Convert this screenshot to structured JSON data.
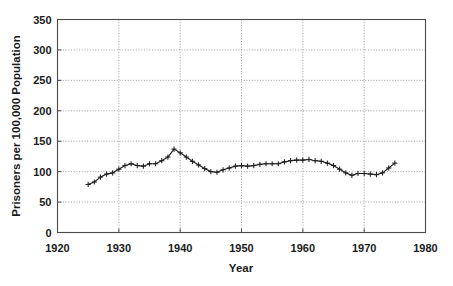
{
  "chart_data": {
    "type": "line",
    "title": "",
    "subtitle": "",
    "xlabel": "Year",
    "ylabel": "Prisoners per 100,000 Population",
    "xlim": [
      1920,
      1980
    ],
    "ylim": [
      0,
      350
    ],
    "xticks": [
      1920,
      1930,
      1940,
      1950,
      1960,
      1970,
      1980
    ],
    "xtick_labels": [
      "1920",
      "1930",
      "1940",
      "1950",
      "1960",
      "1970",
      "1980"
    ],
    "yticks": [
      0,
      50,
      100,
      150,
      200,
      250,
      300,
      350
    ],
    "ytick_labels": [
      "0",
      "50",
      "100",
      "150",
      "200",
      "250",
      "300",
      "350"
    ],
    "grid": "dotted gridlines on both axes",
    "legend": "none",
    "marker": "plus",
    "line_color": "#1f1f1f",
    "grid_color": "#8d8d8d",
    "frame_color": "#4a4a4a",
    "annotations": [],
    "x": [
      1925,
      1926,
      1927,
      1928,
      1929,
      1930,
      1931,
      1932,
      1933,
      1934,
      1935,
      1936,
      1937,
      1938,
      1939,
      1940,
      1941,
      1942,
      1943,
      1944,
      1945,
      1946,
      1947,
      1948,
      1949,
      1950,
      1951,
      1952,
      1953,
      1954,
      1955,
      1956,
      1957,
      1958,
      1959,
      1960,
      1961,
      1962,
      1963,
      1964,
      1965,
      1966,
      1967,
      1968,
      1969,
      1970,
      1971,
      1972,
      1973,
      1974,
      1975
    ],
    "y": [
      79,
      83,
      91,
      96,
      98,
      104,
      110,
      113,
      110,
      109,
      113,
      113,
      118,
      124,
      137,
      131,
      124,
      117,
      111,
      105,
      100,
      99,
      103,
      106,
      109,
      110,
      109,
      110,
      112,
      113,
      113,
      113,
      116,
      118,
      119,
      119,
      120,
      118,
      117,
      114,
      110,
      104,
      98,
      94,
      97,
      97,
      96,
      95,
      98,
      106,
      114
    ],
    "series": [
      {
        "name": "Prisoners per 100,000 Population",
        "values": [
          79,
          83,
          91,
          96,
          98,
          104,
          110,
          113,
          110,
          109,
          113,
          113,
          118,
          124,
          137,
          131,
          124,
          117,
          111,
          105,
          100,
          99,
          103,
          106,
          109,
          110,
          109,
          110,
          112,
          113,
          113,
          113,
          116,
          118,
          119,
          119,
          120,
          118,
          117,
          114,
          110,
          104,
          98,
          94,
          97,
          97,
          96,
          95,
          98,
          106,
          114
        ]
      }
    ]
  }
}
